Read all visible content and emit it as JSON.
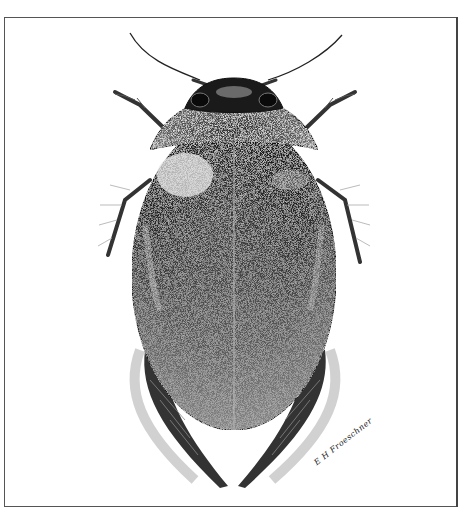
{
  "figure": {
    "signature": "E H Froeschner",
    "clipped_top_text": "",
    "colors": {
      "ink": "#111111",
      "paper": "#ffffff",
      "frame": "#555555"
    }
  }
}
